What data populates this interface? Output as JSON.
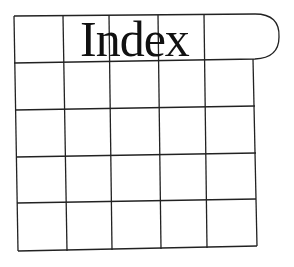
{
  "title": "Index",
  "grid": {
    "columns": 5,
    "rows": 5,
    "line_color": "#222222",
    "background": "#ffffff",
    "top_row_tab": "rounded-right"
  }
}
